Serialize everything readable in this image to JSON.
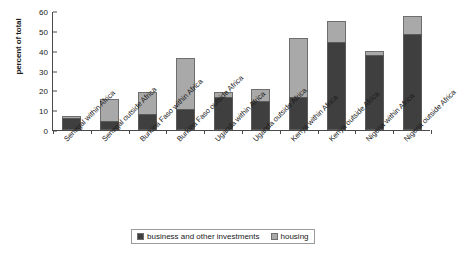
{
  "chart_data": {
    "type": "bar",
    "subtype": "stacked-column",
    "title": "",
    "xlabel": "",
    "ylabel": "percent of total",
    "ylim": [
      0,
      60
    ],
    "yticks": [
      0,
      10,
      20,
      30,
      40,
      50,
      60
    ],
    "grid": false,
    "legend_position": "bottom",
    "categories": [
      "Senegal within Africa",
      "Senegal outside Africa",
      "Burkina Faso within Africa",
      "Burkina Faso outside Africa",
      "Uganda within Africa",
      "Uganda outside Africa",
      "Kenya within Africa",
      "Kenya outside Africa",
      "Nigeria within Africa",
      "Nigeria outside Africa"
    ],
    "series": [
      {
        "name": "business and other investments",
        "color": "#3f3f3f",
        "values": [
          6.0,
          4.5,
          8.0,
          10.5,
          16.5,
          14.5,
          16.5,
          44.5,
          38.0,
          48.5
        ]
      },
      {
        "name": "housing",
        "color": "#a9a9a9",
        "values": [
          1.2,
          11.0,
          11.0,
          26.0,
          2.5,
          6.0,
          30.0,
          10.5,
          2.0,
          9.0
        ]
      }
    ],
    "totals": [
      7.2,
      15.5,
      19.0,
      36.5,
      19.0,
      20.5,
      46.5,
      55.0,
      40.0,
      57.5
    ]
  },
  "legend": {
    "items": [
      {
        "label": "business and other investments",
        "swatch": "business"
      },
      {
        "label": "housing",
        "swatch": "housing"
      }
    ]
  }
}
